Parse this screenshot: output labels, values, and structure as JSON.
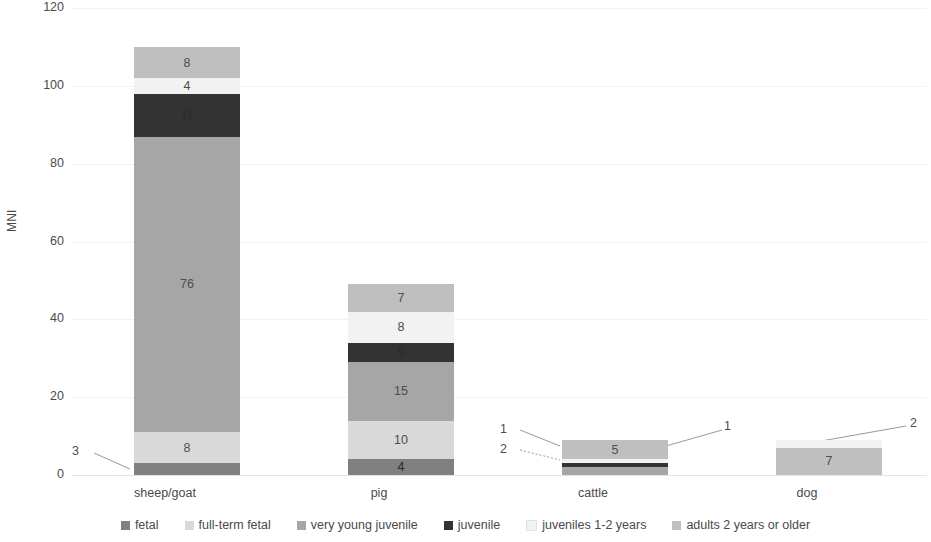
{
  "chart_data": {
    "type": "bar",
    "subtype": "stacked-bar",
    "title": "",
    "xlabel": "",
    "ylabel": "MNI",
    "ylim": [
      0,
      120
    ],
    "yticks": [
      0,
      20,
      40,
      60,
      80,
      100,
      120
    ],
    "grid": true,
    "legend_position": "bottom",
    "categories": [
      "sheep/goat",
      "pig",
      "cattle",
      "dog"
    ],
    "series": [
      {
        "name": "fetal",
        "color": "#808080",
        "values": [
          3,
          4,
          0,
          0
        ]
      },
      {
        "name": "full-term fetal",
        "color": "#d9d9d9",
        "values": [
          8,
          10,
          0,
          0
        ]
      },
      {
        "name": "very young juvenile",
        "color": "#a6a6a6",
        "values": [
          76,
          15,
          2,
          0
        ]
      },
      {
        "name": "juvenile",
        "color": "#333333",
        "values": [
          11,
          5,
          1,
          0
        ]
      },
      {
        "name": "juveniles 1-2 years",
        "color": "#f2f2f2",
        "values": [
          4,
          8,
          1,
          2
        ]
      },
      {
        "name": "adults 2 years or older",
        "color": "#bfbfbf",
        "values": [
          8,
          7,
          5,
          7
        ]
      }
    ],
    "totals": [
      110,
      49,
      9,
      9
    ],
    "callouts": [
      {
        "category": "sheep/goat",
        "series": "fetal",
        "value": 3,
        "side": "left"
      },
      {
        "category": "cattle",
        "series": "very young juvenile",
        "value": 2,
        "side": "left"
      },
      {
        "category": "cattle",
        "series": "juvenile",
        "value": 1,
        "side": "left"
      },
      {
        "category": "cattle",
        "series": "juveniles 1-2 years",
        "value": 1,
        "side": "right"
      },
      {
        "category": "dog",
        "series": "juveniles 1-2 years",
        "value": 2,
        "side": "right"
      }
    ]
  },
  "axis": {
    "y_title": "MNI",
    "y_ticks": [
      "120",
      "100",
      "80",
      "60",
      "40",
      "20",
      "0"
    ],
    "x_categories": [
      "sheep/goat",
      "pig",
      "cattle",
      "dog"
    ]
  },
  "legend": {
    "items": [
      {
        "label": "fetal",
        "color": "#808080"
      },
      {
        "label": "full-term fetal",
        "color": "#d9d9d9"
      },
      {
        "label": "very young juvenile",
        "color": "#a6a6a6"
      },
      {
        "label": "juvenile",
        "color": "#333333"
      },
      {
        "label": "juveniles 1-2 years",
        "color": "#f2f2f2"
      },
      {
        "label": "adults 2 years or older",
        "color": "#bfbfbf"
      }
    ]
  },
  "bar_labels": {
    "sheep_goat": {
      "fetal": "3",
      "full_term_fetal": "8",
      "very_young_juvenile": "76",
      "juvenile": "11",
      "juveniles_1_2": "4",
      "adults": "8"
    },
    "pig": {
      "fetal": "4",
      "full_term_fetal": "10",
      "very_young_juvenile": "15",
      "juvenile": "5",
      "juveniles_1_2": "8",
      "adults": "7"
    },
    "cattle": {
      "very_young_juvenile": "2",
      "juvenile": "1",
      "juveniles_1_2": "1",
      "adults": "5"
    },
    "dog": {
      "juveniles_1_2": "2",
      "adults": "7"
    }
  }
}
